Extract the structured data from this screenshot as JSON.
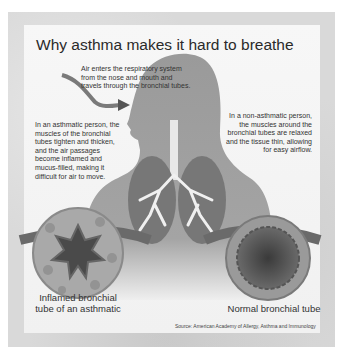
{
  "title": "Why asthma makes it hard to breathe",
  "notes": {
    "air_entry": "Air enters the respiratory system from the nose and mouth and travels through the bronchial tubes.",
    "asthmatic": "In an asthmatic person, the muscles of the bronchial tubes tighten and thicken, and the air passages become inflamed and mucus-filled, making it difficult for air to move.",
    "non_asthmatic": "In a non-asthmatic person, the muscles around the bronchial tubes are relaxed and the tissue thin, allowing for easy airflow."
  },
  "captions": {
    "inflamed": "Inflamed bronchial tube of an asthmatic",
    "normal": "Normal bronchial tube"
  },
  "source": "Source: American Academy of Allergy, Asthma and Immunology"
}
